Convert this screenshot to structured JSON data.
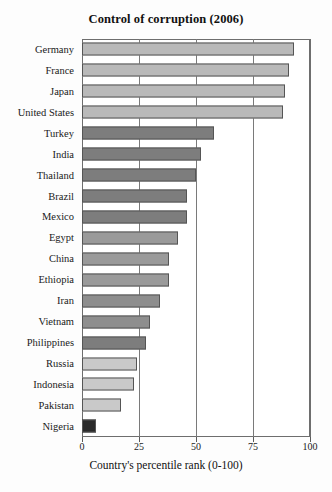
{
  "chart_data": {
    "type": "bar",
    "orientation": "horizontal",
    "title": "Control of corruption (2006)",
    "xlabel": "Country's percentile rank (0-100)",
    "ylabel": "",
    "xlim": [
      0,
      100
    ],
    "xticks": [
      0,
      25,
      50,
      75,
      100
    ],
    "xtick_labels": [
      "0",
      "25",
      "50",
      "75",
      "100"
    ],
    "grid": true,
    "legend": "none",
    "categories": [
      "Germany",
      "France",
      "Japan",
      "United States",
      "Turkey",
      "India",
      "Thailand",
      "Brazil",
      "Mexico",
      "Egypt",
      "China",
      "Ethiopia",
      "Iran",
      "Vietnam",
      "Philippines",
      "Russia",
      "Indonesia",
      "Pakistan",
      "Nigeria"
    ],
    "values": [
      93,
      91,
      89,
      88,
      58,
      52,
      50,
      46,
      46,
      42,
      38,
      38,
      34,
      30,
      28,
      24,
      23,
      17,
      6
    ],
    "bar_colors": [
      "#b9b9b9",
      "#b9b9b9",
      "#b9b9b9",
      "#b9b9b9",
      "#7d7d7d",
      "#7d7d7d",
      "#7d7d7d",
      "#7d7d7d",
      "#7d7d7d",
      "#9a9a9a",
      "#9a9a9a",
      "#9a9a9a",
      "#8e8e8e",
      "#8e8e8e",
      "#7d7d7d",
      "#c9c9c9",
      "#c9c9c9",
      "#c9c9c9",
      "#2a2a2a"
    ]
  },
  "colors": {
    "frame": "#6e6e6e",
    "gridline": "#7a7a7a",
    "bar_outline": "#555555",
    "text": "#111111",
    "background": "#fdfdfd"
  }
}
